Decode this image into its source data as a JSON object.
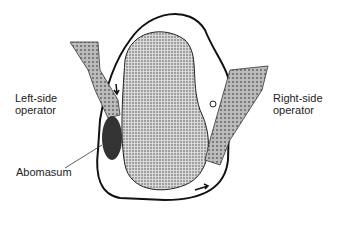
{
  "diagram": {
    "labels": {
      "left_operator": [
        "Left-side",
        "operator"
      ],
      "right_operator": [
        "Right-side",
        "operator"
      ],
      "abomasum": "Abomasum"
    }
  }
}
